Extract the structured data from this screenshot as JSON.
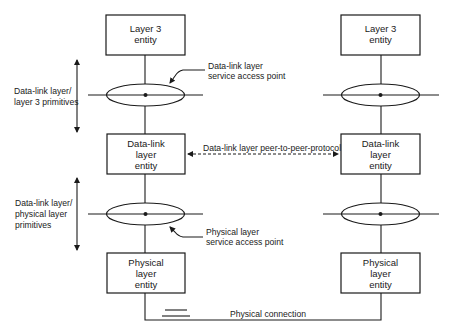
{
  "diagram": {
    "type": "protocol-layer-stack",
    "colors": {
      "line": "#1a1a1a",
      "background": "#ffffff"
    },
    "left_stack": {
      "layer3_box": {
        "line1": "Layer 3",
        "line2": "entity"
      },
      "datalink_box": {
        "line1": "Data-link",
        "line2": "layer",
        "line3": "entity"
      },
      "physical_box": {
        "line1": "Physical",
        "line2": "layer",
        "line3": "entity"
      }
    },
    "right_stack": {
      "layer3_box": {
        "line1": "Layer 3",
        "line2": "entity"
      },
      "datalink_box": {
        "line1": "Data-link",
        "line2": "layer",
        "line3": "entity"
      },
      "physical_box": {
        "line1": "Physical",
        "line2": "layer",
        "line3": "entity"
      }
    },
    "annotations": {
      "dl_l3_primitives": {
        "line1": "Data-link layer/",
        "line2": "layer 3 primitives"
      },
      "dl_phys_primitives": {
        "line1": "Data-link layer/",
        "line2": "physical layer",
        "line3": "primitives"
      },
      "dl_sap": {
        "line1": "Data-link layer",
        "line2": "service access point"
      },
      "phys_sap": {
        "line1": "Physical layer",
        "line2": "service access point"
      },
      "peer_protocol": "Data-link layer peer-to-peer-protocol",
      "physical_connection": "Physical connection"
    }
  }
}
